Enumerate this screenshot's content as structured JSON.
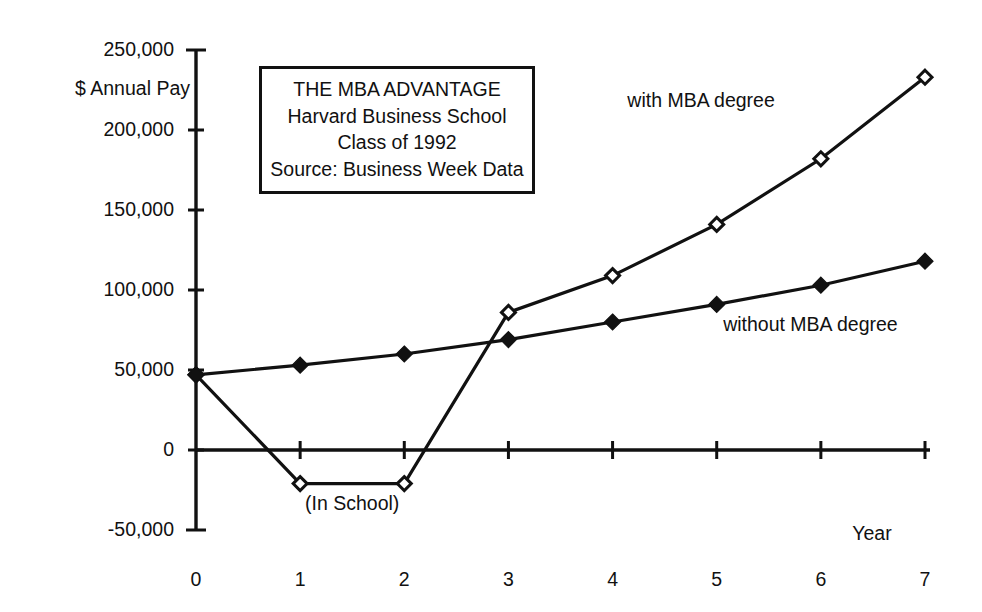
{
  "chart_data": {
    "type": "line",
    "title": "THE MBA ADVANTAGE",
    "xlabel": "Year",
    "ylabel": "$ Annual Pay",
    "x": [
      0,
      1,
      2,
      3,
      4,
      5,
      6,
      7
    ],
    "xticklabels": [
      "0",
      "1",
      "2",
      "3",
      "4",
      "5",
      "6",
      "7"
    ],
    "xlim": [
      0,
      7
    ],
    "ylim": [
      -50000,
      250000
    ],
    "yticks": [
      -50000,
      0,
      50000,
      100000,
      150000,
      200000,
      250000
    ],
    "yticklabels": [
      "-50,000",
      "0",
      "50,000",
      "100,000",
      "150,000",
      "200,000",
      "250,000"
    ],
    "grid": false,
    "legend_position": "inline-annotations",
    "series": [
      {
        "name": "with MBA degree",
        "marker": "open-diamond",
        "values": [
          47000,
          -21000,
          -21000,
          86000,
          109000,
          141000,
          182000,
          233000
        ]
      },
      {
        "name": "without MBA degree",
        "marker": "filled-diamond",
        "values": [
          47000,
          53000,
          60000,
          69000,
          80000,
          91000,
          103000,
          118000
        ]
      }
    ],
    "annotations": [
      {
        "text": "(In School)",
        "x": 1.5,
        "y": -34000
      },
      {
        "text": "with MBA degree",
        "x": 4.85,
        "y": 218000
      },
      {
        "text": "without MBA degree",
        "x": 5.9,
        "y": 78000
      }
    ]
  },
  "title_box": {
    "lines": [
      "THE MBA ADVANTAGE",
      "Harvard Business School",
      "Class of 1992",
      "Source: Business Week Data"
    ]
  },
  "colors": {
    "ink": "#111111",
    "background": "#ffffff"
  }
}
